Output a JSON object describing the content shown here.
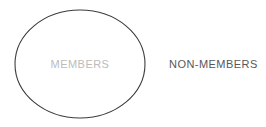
{
  "diagram": {
    "type": "set-diagram",
    "background_color": "#ffffff",
    "inside_set": {
      "label": "MEMBERS",
      "text_color": "#bcbcbc",
      "shape": "ellipse",
      "stroke_color": "#3c3c3e"
    },
    "outside_set": {
      "label": "NON-MEMBERS",
      "text_color": "#57575a"
    }
  }
}
